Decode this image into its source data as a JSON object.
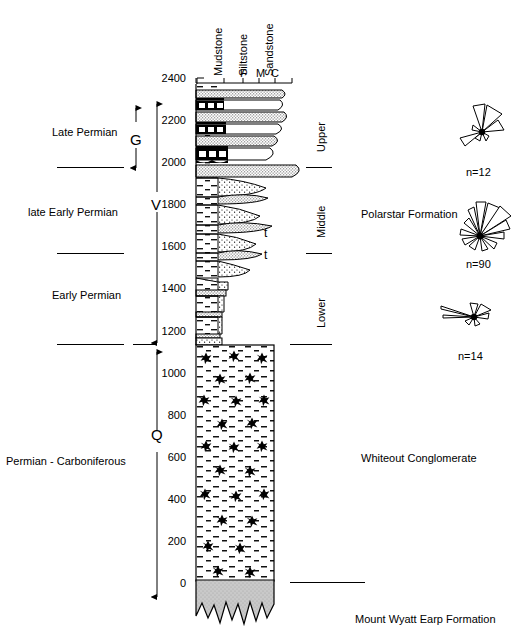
{
  "figure": {
    "type": "stratigraphic-column",
    "grain_size_headers": [
      "Mudstone",
      "Siltstone",
      "Sandstone"
    ],
    "grain_size_ticks": [
      "F",
      "M",
      "C"
    ]
  },
  "axis": {
    "label_unit": "",
    "major_ticks": [
      2400,
      2200,
      2000,
      1800,
      1600,
      1400,
      1200,
      1000,
      800,
      600,
      400,
      200,
      0
    ],
    "minor_interval": 100,
    "min": 0,
    "max": 2400
  },
  "age_labels": [
    {
      "text": "Late Permian"
    },
    {
      "text": "late Early Permian"
    },
    {
      "text": "Early Permian"
    },
    {
      "text": "Permian - Carboniferous"
    }
  ],
  "stage_letters": [
    {
      "text": "G"
    },
    {
      "text": "V"
    },
    {
      "text": "Q"
    }
  ],
  "member_labels": [
    {
      "text": "Upper"
    },
    {
      "text": "Middle"
    },
    {
      "text": "Lower"
    }
  ],
  "formation_labels": [
    {
      "text": "Polarstar Formation"
    },
    {
      "text": "Whiteout Conglomerate"
    },
    {
      "text": "Mount Wyatt Earp Formation"
    }
  ],
  "bed_annotations": [
    {
      "text": "t"
    },
    {
      "text": "t"
    }
  ],
  "rose_diagrams": [
    {
      "count_label": "n=12"
    },
    {
      "count_label": "n=90"
    },
    {
      "count_label": "n=14"
    }
  ],
  "colors": {
    "ink": "#000000",
    "basement_fill": "#c9c9c9",
    "sandstone_fill": "#ffffff",
    "coal_fill": "#000000"
  }
}
